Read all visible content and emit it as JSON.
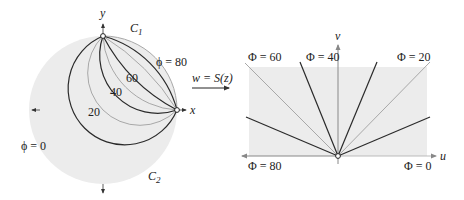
{
  "figure": {
    "left_panel": {
      "axes": {
        "x_label": "x",
        "y_label": "y"
      },
      "curve_labels": {
        "c1": "C",
        "c1_sub": "1",
        "c2": "C",
        "c2_sub": "2",
        "phi80": "ϕ = 80",
        "phi0": "ϕ = 0",
        "l60": "60",
        "l40": "40",
        "l20": "20"
      },
      "level_curves": [
        {
          "phi": 80,
          "style": "boundary-gray"
        },
        {
          "phi": 70,
          "style": "dark"
        },
        {
          "phi": 60,
          "style": "gray"
        },
        {
          "phi": 50,
          "style": "dark"
        },
        {
          "phi": 40,
          "style": "gray"
        },
        {
          "phi": 30,
          "style": "dark"
        },
        {
          "phi": 20,
          "style": "gray"
        },
        {
          "phi": 10,
          "style": "dark"
        }
      ]
    },
    "mapping": {
      "label": "w = S(z)"
    },
    "right_panel": {
      "axes": {
        "u_label": "u",
        "v_label": "v"
      },
      "ray_labels": {
        "phi60": "Φ = 60",
        "phi40": "Φ = 40",
        "phi20": "Φ = 20",
        "phi80": "Φ = 80",
        "phi0": "Φ = 0"
      }
    },
    "colors": {
      "region_fill": "#ececec",
      "dark_line": "#2a2a2a",
      "gray_line": "#a8a8a8",
      "axis": "#888888"
    }
  }
}
